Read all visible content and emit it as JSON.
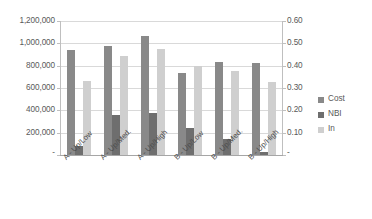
{
  "chart_data": {
    "type": "bar",
    "title": "",
    "xlabel": "",
    "ylabel": "",
    "grid": true,
    "legend_position": "right",
    "categories": [
      "A - Up/Low",
      "A - Up/Med.",
      "A - Up/High",
      "B - Up/Low",
      "B - Up/Med.",
      "B - Up/High"
    ],
    "series": [
      {
        "name": "Cost",
        "axis": "left",
        "color": "#898989",
        "values": [
          940000,
          975000,
          1070000,
          735000,
          830000,
          825000
        ]
      },
      {
        "name": "NBI",
        "axis": "right",
        "color": "#6e6e6e",
        "values": [
          0.04,
          0.18,
          0.19,
          0.12,
          0.07,
          0.015
        ]
      },
      {
        "name": "In",
        "axis": "left",
        "color": "#cfcfcf",
        "values": [
          665000,
          885000,
          950000,
          800000,
          755000,
          655000
        ]
      }
    ],
    "left_axis": {
      "min": 0,
      "max": 1200000,
      "step": 200000,
      "ticks": [
        "1,200,000",
        "1,000,000",
        "800,000",
        "600,000",
        "400,000",
        "200,000",
        "-"
      ]
    },
    "right_axis": {
      "min": 0,
      "max": 0.6,
      "step": 0.1,
      "ticks": [
        "0.60",
        "0.50",
        "0.40",
        "0.30",
        "0.20",
        "0.10",
        "-"
      ]
    },
    "legend": [
      "Cost",
      "NBI",
      "In"
    ]
  }
}
